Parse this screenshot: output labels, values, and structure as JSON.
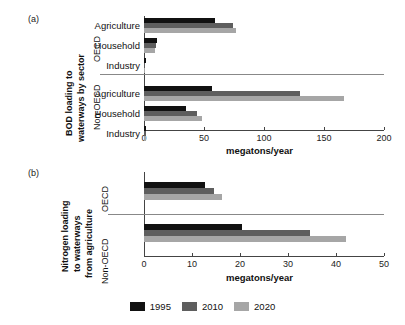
{
  "figure": {
    "panel_a_letter": "(a)",
    "panel_b_letter": "(b)"
  },
  "legend": {
    "position": "bottom-center",
    "items": [
      {
        "label": "1995",
        "color": "#111111"
      },
      {
        "label": "2010",
        "color": "#5e5e5e"
      },
      {
        "label": "2020",
        "color": "#a6a6a6"
      }
    ]
  },
  "panel_a": {
    "ylabel_line1": "BOD loading to",
    "ylabel_line2": "waterways by sector",
    "xlabel": "megatons/year",
    "group_labels": [
      "OECD",
      "Non-OECD"
    ],
    "categories": [
      "Agriculture",
      "Household",
      "Industry"
    ],
    "ticks": [
      "0",
      "50",
      "100",
      "150",
      "200"
    ]
  },
  "panel_b": {
    "ylabel_line1": "Nitrogen loading",
    "ylabel_line2": "to waterways",
    "ylabel_line3": "from agriculture",
    "xlabel": "megatons/year",
    "group_labels": [
      "OECD",
      "Non-OECD"
    ],
    "ticks": [
      "0",
      "10",
      "20",
      "30",
      "40",
      "50"
    ]
  },
  "chart_data": [
    {
      "type": "bar",
      "orientation": "horizontal",
      "title": "BOD loading to waterways by sector",
      "panel": "(a)",
      "xlabel": "megatons/year",
      "ylabel": "BOD loading to waterways by sector",
      "xlim": [
        0,
        200
      ],
      "xticks": [
        0,
        50,
        100,
        150,
        200
      ],
      "grid": false,
      "legend": [
        "1995",
        "2010",
        "2020"
      ],
      "groups": [
        {
          "name": "OECD",
          "categories": [
            "Agriculture",
            "Household",
            "Industry"
          ],
          "series": [
            {
              "name": "1995",
              "color": "#111111",
              "values": [
                59,
                11,
                1.5
              ]
            },
            {
              "name": "2010",
              "color": "#5e5e5e",
              "values": [
                74,
                10,
                1.2
              ]
            },
            {
              "name": "2020",
              "color": "#a6a6a6",
              "values": [
                77,
                9,
                1.0
              ]
            }
          ]
        },
        {
          "name": "Non-OECD",
          "categories": [
            "Agriculture",
            "Household",
            "Industry"
          ],
          "series": [
            {
              "name": "1995",
              "color": "#111111",
              "values": [
                57,
                35,
                2.0
              ]
            },
            {
              "name": "2010",
              "color": "#5e5e5e",
              "values": [
                130,
                44,
                1.8
              ]
            },
            {
              "name": "2020",
              "color": "#a6a6a6",
              "values": [
                167,
                48,
                1.5
              ]
            }
          ]
        }
      ]
    },
    {
      "type": "bar",
      "orientation": "horizontal",
      "title": "Nitrogen loading to waterways from agriculture",
      "panel": "(b)",
      "xlabel": "megatons/year",
      "ylabel": "Nitrogen loading to waterways from agriculture",
      "xlim": [
        0,
        50
      ],
      "xticks": [
        0,
        10,
        20,
        30,
        40,
        50
      ],
      "grid": false,
      "legend": [
        "1995",
        "2010",
        "2020"
      ],
      "groups": [
        {
          "name": "OECD",
          "categories": [
            "agriculture"
          ],
          "series": [
            {
              "name": "1995",
              "color": "#111111",
              "values": [
                12.8
              ]
            },
            {
              "name": "2010",
              "color": "#5e5e5e",
              "values": [
                14.6
              ]
            },
            {
              "name": "2020",
              "color": "#a6a6a6",
              "values": [
                16.2
              ]
            }
          ]
        },
        {
          "name": "Non-OECD",
          "categories": [
            "agriculture"
          ],
          "series": [
            {
              "name": "1995",
              "color": "#111111",
              "values": [
                20.4
              ]
            },
            {
              "name": "2010",
              "color": "#5e5e5e",
              "values": [
                34.6
              ]
            },
            {
              "name": "2020",
              "color": "#a6a6a6",
              "values": [
                42.0
              ]
            }
          ]
        }
      ]
    }
  ]
}
